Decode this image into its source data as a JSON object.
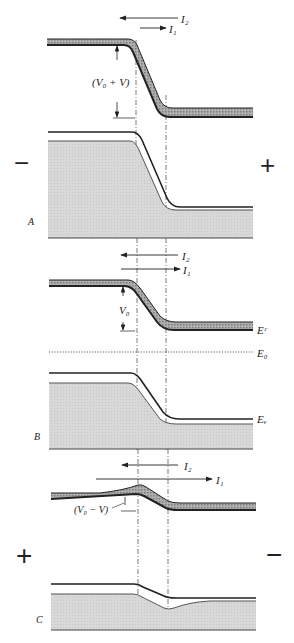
{
  "figure": {
    "panels": [
      {
        "id": "A",
        "label": "A",
        "left_sign": "−",
        "right_sign": "+",
        "current_2": "I₂",
        "current_1": "I₁",
        "barrier_label": "(V₀ + V)"
      },
      {
        "id": "B",
        "label": "B",
        "current_2": "I₂",
        "current_1": "I₁",
        "barrier_label": "V₀",
        "conduction_band": "Eᶜ",
        "fermi_level": "E₀",
        "valence_band": "Eᵥ"
      },
      {
        "id": "C",
        "label": "C",
        "left_sign": "+",
        "right_sign": "−",
        "current_2": "I₂",
        "current_1": "I₁",
        "barrier_label": "(V₀ − V)"
      }
    ],
    "colors": {
      "ink": "#222222",
      "band_hatch": "#9a9a9a",
      "valence_fill": "#d6d6d6"
    }
  }
}
